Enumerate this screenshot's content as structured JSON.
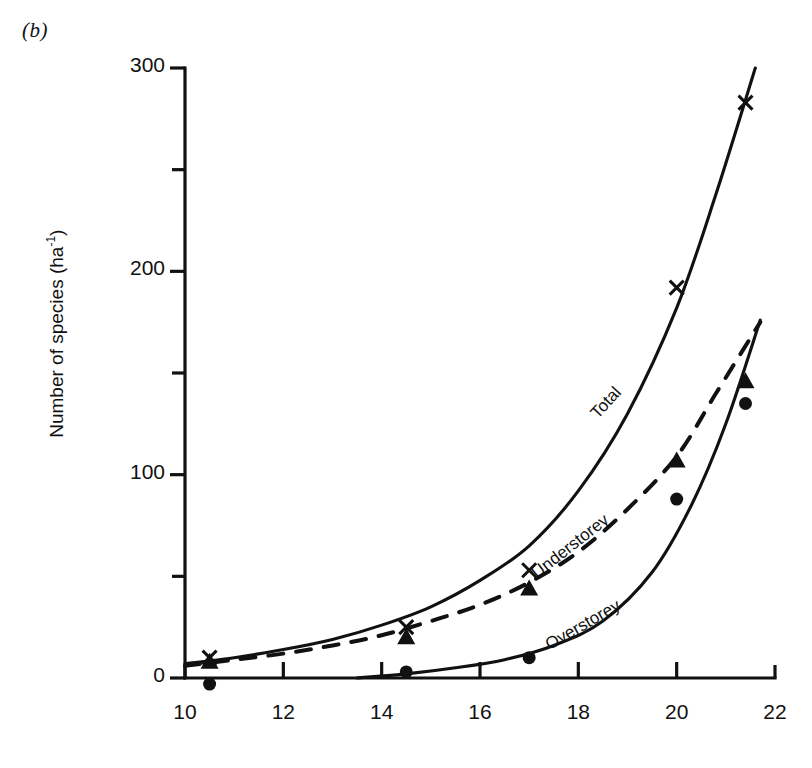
{
  "figure": {
    "panel_label": "(b)",
    "ylabel_text": "Number of species (ha",
    "ylabel_sup": "-1",
    "ylabel_tail": ")"
  },
  "axes": {
    "y_ticks_major": [
      "0",
      "100",
      "200",
      "300"
    ],
    "x_ticks": [
      "10",
      "12",
      "14",
      "16",
      "18",
      "20",
      "22"
    ]
  },
  "curve_labels": {
    "total": "Total",
    "understorey": "Understorey",
    "overstorey": "Overstorey"
  },
  "chart_data": {
    "type": "scatter",
    "title": "(b)",
    "xlabel": "",
    "ylabel": "Number of species (ha-1)",
    "xlim": [
      10,
      22
    ],
    "ylim": [
      0,
      300
    ],
    "x_ticks": [
      10,
      12,
      14,
      16,
      18,
      20,
      22
    ],
    "y_ticks_major": [
      0,
      100,
      200,
      300
    ],
    "y_ticks_minor": [
      50,
      150,
      250
    ],
    "grid": false,
    "legend": "inline curve labels",
    "series": [
      {
        "name": "Total",
        "marker": "cross",
        "line": "solid",
        "points": [
          {
            "x": 10.5,
            "y": 10
          },
          {
            "x": 14.5,
            "y": 25
          },
          {
            "x": 17.0,
            "y": 53
          },
          {
            "x": 20.0,
            "y": 192
          },
          {
            "x": 21.4,
            "y": 283
          }
        ],
        "fit_curve": [
          {
            "x": 10.0,
            "y": 7
          },
          {
            "x": 11.0,
            "y": 10
          },
          {
            "x": 12.0,
            "y": 14
          },
          {
            "x": 13.0,
            "y": 19
          },
          {
            "x": 14.0,
            "y": 26
          },
          {
            "x": 15.0,
            "y": 35
          },
          {
            "x": 16.0,
            "y": 48
          },
          {
            "x": 17.0,
            "y": 65
          },
          {
            "x": 18.0,
            "y": 92
          },
          {
            "x": 19.0,
            "y": 130
          },
          {
            "x": 20.0,
            "y": 182
          },
          {
            "x": 20.8,
            "y": 238
          },
          {
            "x": 21.6,
            "y": 300
          }
        ]
      },
      {
        "name": "Understorey",
        "marker": "triangle",
        "line": "dashed",
        "points": [
          {
            "x": 10.5,
            "y": 8
          },
          {
            "x": 14.5,
            "y": 20
          },
          {
            "x": 17.0,
            "y": 44
          },
          {
            "x": 20.0,
            "y": 107
          },
          {
            "x": 21.4,
            "y": 146
          }
        ],
        "fit_curve": [
          {
            "x": 10.0,
            "y": 6
          },
          {
            "x": 11.0,
            "y": 9
          },
          {
            "x": 12.0,
            "y": 12
          },
          {
            "x": 13.0,
            "y": 16
          },
          {
            "x": 14.0,
            "y": 21
          },
          {
            "x": 15.0,
            "y": 28
          },
          {
            "x": 16.0,
            "y": 36
          },
          {
            "x": 17.0,
            "y": 47
          },
          {
            "x": 18.0,
            "y": 62
          },
          {
            "x": 19.0,
            "y": 83
          },
          {
            "x": 20.0,
            "y": 109
          },
          {
            "x": 20.8,
            "y": 140
          },
          {
            "x": 21.7,
            "y": 175
          }
        ]
      },
      {
        "name": "Overstorey",
        "marker": "circle",
        "line": "solid",
        "points": [
          {
            "x": 10.5,
            "y": -3
          },
          {
            "x": 14.5,
            "y": 3
          },
          {
            "x": 17.0,
            "y": 10
          },
          {
            "x": 20.0,
            "y": 88
          },
          {
            "x": 21.4,
            "y": 135
          }
        ],
        "fit_curve": [
          {
            "x": 13.5,
            "y": 0
          },
          {
            "x": 14.5,
            "y": 2
          },
          {
            "x": 15.5,
            "y": 5
          },
          {
            "x": 16.5,
            "y": 9
          },
          {
            "x": 17.5,
            "y": 16
          },
          {
            "x": 18.5,
            "y": 28
          },
          {
            "x": 19.5,
            "y": 52
          },
          {
            "x": 20.3,
            "y": 85
          },
          {
            "x": 21.0,
            "y": 125
          },
          {
            "x": 21.7,
            "y": 176
          }
        ]
      }
    ]
  }
}
